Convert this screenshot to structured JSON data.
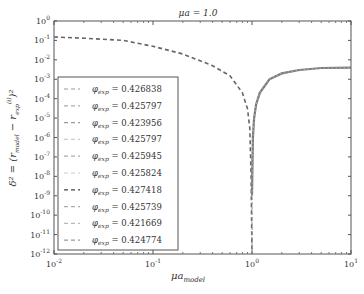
{
  "chart_data": {
    "type": "line",
    "title": "μa = 1.0",
    "xlabel": "μa_model",
    "ylabel": "δ² = (r_model − r_exp^(i))²",
    "xscale": "log",
    "yscale": "log",
    "xlim": [
      0.01,
      10
    ],
    "ylim": [
      1e-12,
      1
    ],
    "x_ticks": [
      "10^-2",
      "10^-1",
      "10^0",
      "10^1"
    ],
    "y_ticks": [
      "10^0",
      "10^-1",
      "10^-2",
      "10^-3",
      "10^-4",
      "10^-5",
      "10^-6",
      "10^-7",
      "10^-8",
      "10^-9",
      "10^-10",
      "10^-11",
      "10^-12"
    ],
    "grid": false,
    "legend_position": "lower left",
    "legend": [
      {
        "label": "φ_exp = 0.426838",
        "color": "#999999"
      },
      {
        "label": "φ_exp = 0.425797",
        "color": "#aaaaaa"
      },
      {
        "label": "φ_exp = 0.423956",
        "color": "#999999"
      },
      {
        "label": "φ_exp = 0.425797",
        "color": "#cccccc"
      },
      {
        "label": "φ_exp = 0.425945",
        "color": "#aaaaaa"
      },
      {
        "label": "φ_exp = 0.425824",
        "color": "#cccccc"
      },
      {
        "label": "φ_exp = 0.427418",
        "color": "#444444"
      },
      {
        "label": "φ_exp = 0.425739",
        "color": "#aaaaaa"
      },
      {
        "label": "φ_exp = 0.421669",
        "color": "#bbbbbb"
      },
      {
        "label": "φ_exp = 0.424774",
        "color": "#999999"
      }
    ],
    "series": [
      {
        "name": "dashed branch (all φ_exp, overlapping)",
        "style": "dashed",
        "x": [
          0.01,
          0.02,
          0.05,
          0.1,
          0.2,
          0.4,
          0.6,
          0.8,
          0.9,
          0.95,
          0.98,
          1.0
        ],
        "y": [
          0.15,
          0.13,
          0.1,
          0.05,
          0.02,
          0.005,
          0.0015,
          0.0002,
          3e-05,
          3e-06,
          1e-08,
          1e-12
        ]
      },
      {
        "name": "solid branch (all φ_exp, overlapping)",
        "style": "solid",
        "x": [
          1.0,
          1.02,
          1.05,
          1.1,
          1.2,
          1.5,
          2,
          3,
          5,
          10
        ],
        "y": [
          1e-09,
          1e-06,
          1e-05,
          5e-05,
          0.0002,
          0.001,
          0.002,
          0.003,
          0.0038,
          0.004
        ]
      }
    ]
  },
  "labels": {
    "title": "μa = 1.0",
    "xlabel_main": "μa",
    "xlabel_sub": "model",
    "ylabel": "δ² = (r",
    "legend_prefix": "φ",
    "legend_sub": "exp",
    "legend_values": [
      "= 0.426838",
      "= 0.425797",
      "= 0.423956",
      "= 0.425797",
      "= 0.425945",
      "= 0.425824",
      "= 0.427418",
      "= 0.425739",
      "= 0.421669",
      "= 0.424774"
    ]
  }
}
